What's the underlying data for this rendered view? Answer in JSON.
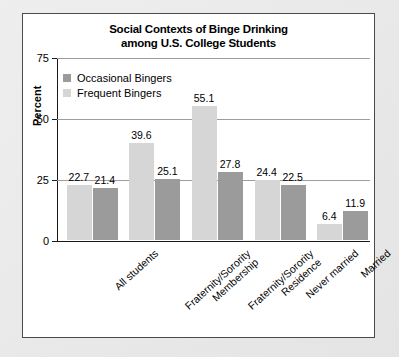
{
  "chart_data": {
    "type": "bar",
    "title": "Social Contexts of Binge Drinking among U.S. College Students",
    "title_line1": "Social Contexts of Binge Drinking",
    "title_line2": "among U.S. College Students",
    "xlabel": "",
    "ylabel": "Percent",
    "ylim": [
      0,
      75
    ],
    "yticks": [
      0,
      25,
      50,
      75
    ],
    "ytick_labels": [
      "0",
      "25",
      "50",
      "75"
    ],
    "grid": true,
    "legend_position": "top-left",
    "categories": [
      "All students",
      "Fraternity/Sorority Membership",
      "Fraternity/Sorority Residence",
      "Never married",
      "Married"
    ],
    "category_lines": [
      [
        "All students"
      ],
      [
        "Fraternity/Sorority",
        "Membership"
      ],
      [
        "Fraternity/Sorority",
        "Residence"
      ],
      [
        "Never married"
      ],
      [
        "Married"
      ]
    ],
    "series": [
      {
        "name": "Frequent Bingers",
        "color": "#d6d6d6",
        "values": [
          22.7,
          39.6,
          55.1,
          24.4,
          6.4
        ],
        "value_labels": [
          "22.7",
          "39.6",
          "55.1",
          "24.4",
          "6.4"
        ]
      },
      {
        "name": "Occasional Bingers",
        "color": "#9b9b9b",
        "values": [
          21.4,
          25.1,
          27.8,
          22.5,
          11.9
        ],
        "value_labels": [
          "21.4",
          "25.1",
          "27.8",
          "22.5",
          "11.9"
        ]
      }
    ],
    "legend": [
      {
        "label": "Occasional Bingers",
        "color": "#9b9b9b"
      },
      {
        "label": "Frequent Bingers",
        "color": "#d6d6d6"
      }
    ]
  }
}
